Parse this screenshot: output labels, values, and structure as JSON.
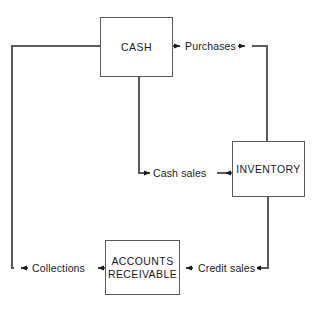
{
  "diagram": {
    "colors": {
      "line": "#5a5a5a",
      "text": "#1a1a1a",
      "background": "#ffffff"
    },
    "nodes": [
      {
        "id": "cash",
        "label": "CASH"
      },
      {
        "id": "inventory",
        "label": "INVENTORY"
      },
      {
        "id": "ar",
        "label": "ACCOUNTS\nRECEIVABLE"
      }
    ],
    "edge_labels": [
      {
        "id": "purchases",
        "label": "Purchases"
      },
      {
        "id": "cash_sales",
        "label": "Cash sales"
      },
      {
        "id": "credit_sales",
        "label": "Credit sales"
      },
      {
        "id": "collections",
        "label": "Collections"
      }
    ]
  }
}
